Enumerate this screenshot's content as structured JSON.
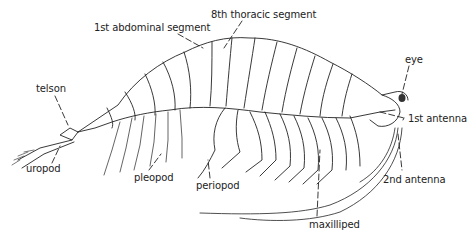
{
  "figure": {
    "line_color": "#222222",
    "background": "#ffffff"
  },
  "labels": {
    "telson": "telson",
    "uropod": "uropod",
    "first_abdominal_segment": "1st abdominal segment",
    "eighth_thoracic_segment": "8th thoracic segment",
    "eye": "eye",
    "first_antenna": "1st antenna",
    "second_antenna": "2nd antenna",
    "pleopod": "pleopod",
    "periopod": "periopod",
    "maxilliped": "maxilliped"
  }
}
